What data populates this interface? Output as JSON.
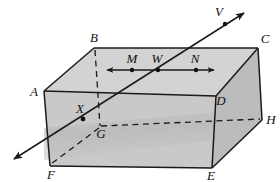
{
  "figure": {
    "type": "geometry-diagram",
    "background_color": "#ffffff",
    "colors": {
      "front_face": "#c9c9c9",
      "top_face": "#d2d2d2",
      "right_face": "#bdbdbd",
      "outline": "#1a1a1a",
      "label": "#111111",
      "shadow": "#b4b4b4"
    }
  },
  "vertices": [
    {
      "name": "A",
      "label": "A",
      "x": 44,
      "y": 91
    },
    {
      "name": "B",
      "label": "B",
      "x": 94,
      "y": 48
    },
    {
      "name": "C",
      "label": "C",
      "x": 258,
      "y": 48
    },
    {
      "name": "D",
      "label": "D",
      "x": 216,
      "y": 96
    },
    {
      "name": "E",
      "label": "E",
      "x": 212,
      "y": 168
    },
    {
      "name": "F",
      "label": "F",
      "x": 50,
      "y": 166
    },
    {
      "name": "G",
      "label": "G",
      "x": 100,
      "y": 128
    },
    {
      "name": "H",
      "label": "H",
      "x": 262,
      "y": 120
    }
  ],
  "points": [
    {
      "name": "M",
      "label": "M",
      "x": 132,
      "y": 70,
      "dot": true
    },
    {
      "name": "W",
      "label": "W",
      "x": 158,
      "y": 70,
      "dot": true
    },
    {
      "name": "N",
      "label": "N",
      "x": 196,
      "y": 70,
      "dot": true
    },
    {
      "name": "X",
      "label": "X",
      "x": 82,
      "y": 117,
      "dot": true
    },
    {
      "name": "V",
      "label": "V",
      "x": 225,
      "y": 20,
      "dot": true
    }
  ],
  "segments": {
    "double_arrow_top": {
      "name": "MN-double-arrow",
      "from": {
        "x": 106,
        "y": 70
      },
      "to": {
        "x": 215,
        "y": 70
      },
      "arrowheads": "both"
    },
    "line_VF": {
      "name": "line-V-F",
      "from": {
        "x": 12,
        "y": 160
      },
      "to": {
        "x": 246,
        "y": 12
      },
      "arrowheads": "both",
      "through": [
        "F",
        "X",
        "W",
        "V"
      ]
    }
  },
  "hidden_edges": [
    {
      "name": "edge-B-G",
      "from": "B",
      "to": "G"
    },
    {
      "name": "edge-G-F",
      "from": "G",
      "to": "F"
    },
    {
      "name": "edge-G-H",
      "from": "G",
      "to": "H"
    }
  ],
  "visible_edges": [
    {
      "name": "edge-A-B"
    },
    {
      "name": "edge-B-C"
    },
    {
      "name": "edge-C-D"
    },
    {
      "name": "edge-A-D"
    },
    {
      "name": "edge-A-F"
    },
    {
      "name": "edge-D-E"
    },
    {
      "name": "edge-F-E"
    },
    {
      "name": "edge-C-H"
    },
    {
      "name": "edge-E-H"
    }
  ],
  "labels_list": [
    "A",
    "B",
    "C",
    "D",
    "E",
    "F",
    "G",
    "H",
    "M",
    "W",
    "N",
    "X",
    "V"
  ]
}
